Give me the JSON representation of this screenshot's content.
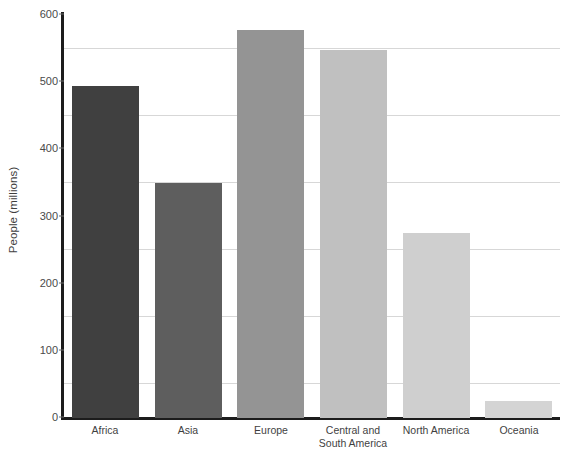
{
  "chart_data": {
    "type": "bar",
    "title": "",
    "xlabel": "",
    "ylabel": "People (millions)",
    "ylim": [
      0,
      600
    ],
    "ytick_values": [
      0,
      100,
      200,
      300,
      400,
      500,
      600
    ],
    "ytick_labels": [
      "0",
      "100",
      "200",
      "300",
      "400",
      "500",
      "600"
    ],
    "gridlines": [
      50,
      150,
      250,
      350,
      450,
      550
    ],
    "grid": true,
    "legend": "none",
    "categories": [
      "Africa",
      "Asia",
      "Europe",
      "Central and South America",
      "North America",
      "Oceania"
    ],
    "category_lines": [
      [
        "Africa"
      ],
      [
        "Asia"
      ],
      [
        "Europe"
      ],
      [
        "Central and",
        "South America"
      ],
      [
        "North America"
      ],
      [
        "Oceania"
      ]
    ],
    "values": [
      495,
      350,
      578,
      548,
      275,
      25
    ],
    "bar_colors": [
      "#404040",
      "#5e5e5e",
      "#949494",
      "#c0c0c0",
      "#cfcfcf",
      "#d4d4d4"
    ]
  },
  "colors": {
    "background": "#ffffff",
    "axis": "#1c1c1c",
    "gridline": "#d7d7d7",
    "text": "#3f3f3f"
  }
}
